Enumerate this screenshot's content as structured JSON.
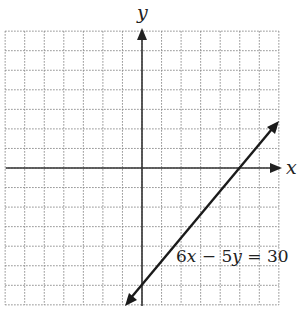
{
  "chart_data": {
    "type": "line",
    "title": "",
    "xlabel": "x",
    "ylabel": "y",
    "xlim": [
      -7,
      7
    ],
    "ylim": [
      -7,
      7
    ],
    "grid": true,
    "grid_style": "dotted",
    "ticks_labeled": false,
    "series": [
      {
        "name": "6x − 5y = 30",
        "equation": "6x - 5y = 30",
        "slope": 1.2,
        "y_intercept": -6,
        "x_intercept": 5,
        "x": [
          -0.8,
          7
        ],
        "y": [
          -7,
          2.4
        ],
        "arrows_both_ends": true
      }
    ],
    "annotations": [
      {
        "text": "6x − 5y = 30",
        "x": 3.3,
        "y": -4.3
      }
    ]
  },
  "labels": {
    "x_axis": "x",
    "y_axis": "y",
    "equation": {
      "c1": "6",
      "v1": "x",
      "op": " − 5",
      "v2": "y",
      "rhs": " = 30"
    }
  },
  "colors": {
    "line": "#1a1a1a",
    "axis": "#333333",
    "grid": "#8a8a8a",
    "background": "#ffffff"
  }
}
